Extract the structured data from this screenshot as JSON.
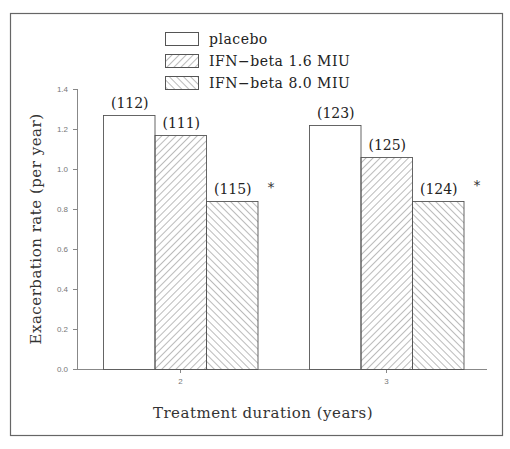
{
  "chart_data": {
    "type": "bar",
    "title": "",
    "xlabel": "Treatment duration (years)",
    "ylabel": "Exacerbation rate (per year)",
    "ylim": [
      0.0,
      1.4
    ],
    "yticks": [
      "0.0",
      "0.2",
      "0.4",
      "0.6",
      "0.8",
      "1.0",
      "1.2",
      "1.4"
    ],
    "categories": [
      "2",
      "3"
    ],
    "grid": false,
    "legend_position": "top-center",
    "series": [
      {
        "name": "placebo",
        "pattern": "none",
        "values": [
          1.27,
          1.22
        ],
        "n_labels": [
          "(112)",
          "(123)"
        ]
      },
      {
        "name": "IFN−beta 1.6 MIU",
        "pattern": "backslash-hatch",
        "values": [
          1.17,
          1.06
        ],
        "n_labels": [
          "(111)",
          "(125)"
        ]
      },
      {
        "name": "IFN−beta 8.0 MIU",
        "pattern": "slash-hatch",
        "values": [
          0.84,
          0.84
        ],
        "n_labels": [
          "(115)",
          "(124)"
        ]
      }
    ],
    "annotations": [
      {
        "text": "*",
        "category": "2",
        "series": "IFN−beta 8.0 MIU"
      },
      {
        "text": "*",
        "category": "3",
        "series": "IFN−beta 8.0 MIU"
      }
    ]
  },
  "legend": {
    "items": [
      {
        "label": "placebo"
      },
      {
        "label": "IFN−beta 1.6 MIU"
      },
      {
        "label": "IFN−beta 8.0 MIU"
      }
    ]
  },
  "axes": {
    "xlabel": "Treatment duration (years)",
    "ylabel": "Exacerbation rate (per year)",
    "yticks": [
      "0.0",
      "0.2",
      "0.4",
      "0.6",
      "0.8",
      "1.0",
      "1.2",
      "1.4"
    ],
    "xticks": [
      "2",
      "3"
    ]
  },
  "annotations": {
    "star": "*"
  }
}
